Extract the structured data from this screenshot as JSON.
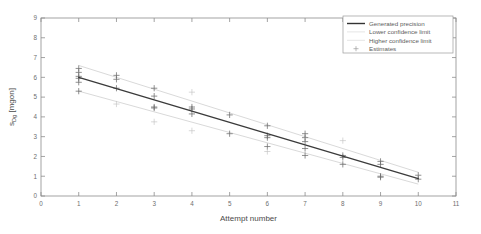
{
  "figure": {
    "background_color": "#ffffff",
    "axes_color": "#8d8d8d",
    "line_color": "#3b3b3b",
    "marker_color": "#6b6b6b"
  },
  "axis": {
    "x_title": "Attempt number",
    "y_title_main": "s",
    "y_title_sub": "Dg",
    "y_title_unit": " [mgon]",
    "y_title_full": "s_Dg [mgon]",
    "x_ticks": [
      "0",
      "1",
      "2",
      "3",
      "4",
      "5",
      "6",
      "7",
      "8",
      "9",
      "10",
      "11"
    ],
    "y_ticks": [
      "0",
      "1",
      "2",
      "3",
      "4",
      "5",
      "6",
      "7",
      "8",
      "9"
    ]
  },
  "legend": {
    "items": [
      {
        "label": "Generated precision",
        "marker": "solid-line"
      },
      {
        "label": "Lower confidence limit",
        "marker": "faint-line"
      },
      {
        "label": "Higher confidence limit",
        "marker": "faint-line"
      },
      {
        "label": "Estimates",
        "marker": "plus-marker"
      }
    ]
  },
  "chart_data": {
    "type": "scatter",
    "title": "",
    "xlabel": "Attempt number",
    "ylabel": "s_Dg [mgon]",
    "xlim": [
      0,
      11
    ],
    "ylim": [
      0,
      9
    ],
    "xticks": [
      0,
      1,
      2,
      3,
      4,
      5,
      6,
      7,
      8,
      9,
      10,
      11
    ],
    "yticks": [
      0,
      1,
      2,
      3,
      4,
      5,
      6,
      7,
      8,
      9
    ],
    "grid": false,
    "legend_position": "top-right",
    "series": [
      {
        "name": "Generated precision",
        "type": "line",
        "x": [
          1,
          10
        ],
        "y": [
          6.0,
          0.88
        ]
      },
      {
        "name": "Lower confidence limit",
        "type": "line",
        "x": [
          1,
          10
        ],
        "y": [
          5.3,
          0.6
        ]
      },
      {
        "name": "Higher confidence limit",
        "type": "line",
        "x": [
          1,
          10
        ],
        "y": [
          6.6,
          1.2
        ]
      },
      {
        "name": "Estimates",
        "type": "scatter",
        "marker": "+",
        "points": [
          [
            1,
            6.45
          ],
          [
            1,
            6.25
          ],
          [
            1,
            6.05
          ],
          [
            1,
            5.95
          ],
          [
            1,
            5.75
          ],
          [
            1,
            5.3
          ],
          [
            2,
            6.1
          ],
          [
            2,
            5.9
          ],
          [
            2,
            5.45
          ],
          [
            2,
            4.65
          ],
          [
            3,
            5.45
          ],
          [
            3,
            5.05
          ],
          [
            3,
            4.5
          ],
          [
            3,
            4.45
          ],
          [
            3,
            3.75
          ],
          [
            4,
            5.25
          ],
          [
            4,
            4.5
          ],
          [
            4,
            4.4
          ],
          [
            4,
            4.15
          ],
          [
            4,
            3.3
          ],
          [
            5,
            4.1
          ],
          [
            5,
            3.15
          ],
          [
            6,
            3.55
          ],
          [
            6,
            3.05
          ],
          [
            6,
            2.95
          ],
          [
            6,
            2.5
          ],
          [
            6,
            2.25
          ],
          [
            7,
            3.15
          ],
          [
            7,
            2.95
          ],
          [
            7,
            2.75
          ],
          [
            7,
            2.4
          ],
          [
            7,
            2.05
          ],
          [
            8,
            2.8
          ],
          [
            8,
            2.05
          ],
          [
            8,
            1.95
          ],
          [
            8,
            1.6
          ],
          [
            9,
            1.75
          ],
          [
            9,
            1.6
          ],
          [
            9,
            1.0
          ],
          [
            9,
            0.95
          ],
          [
            10,
            1.05
          ],
          [
            10,
            0.85
          ]
        ]
      }
    ]
  }
}
